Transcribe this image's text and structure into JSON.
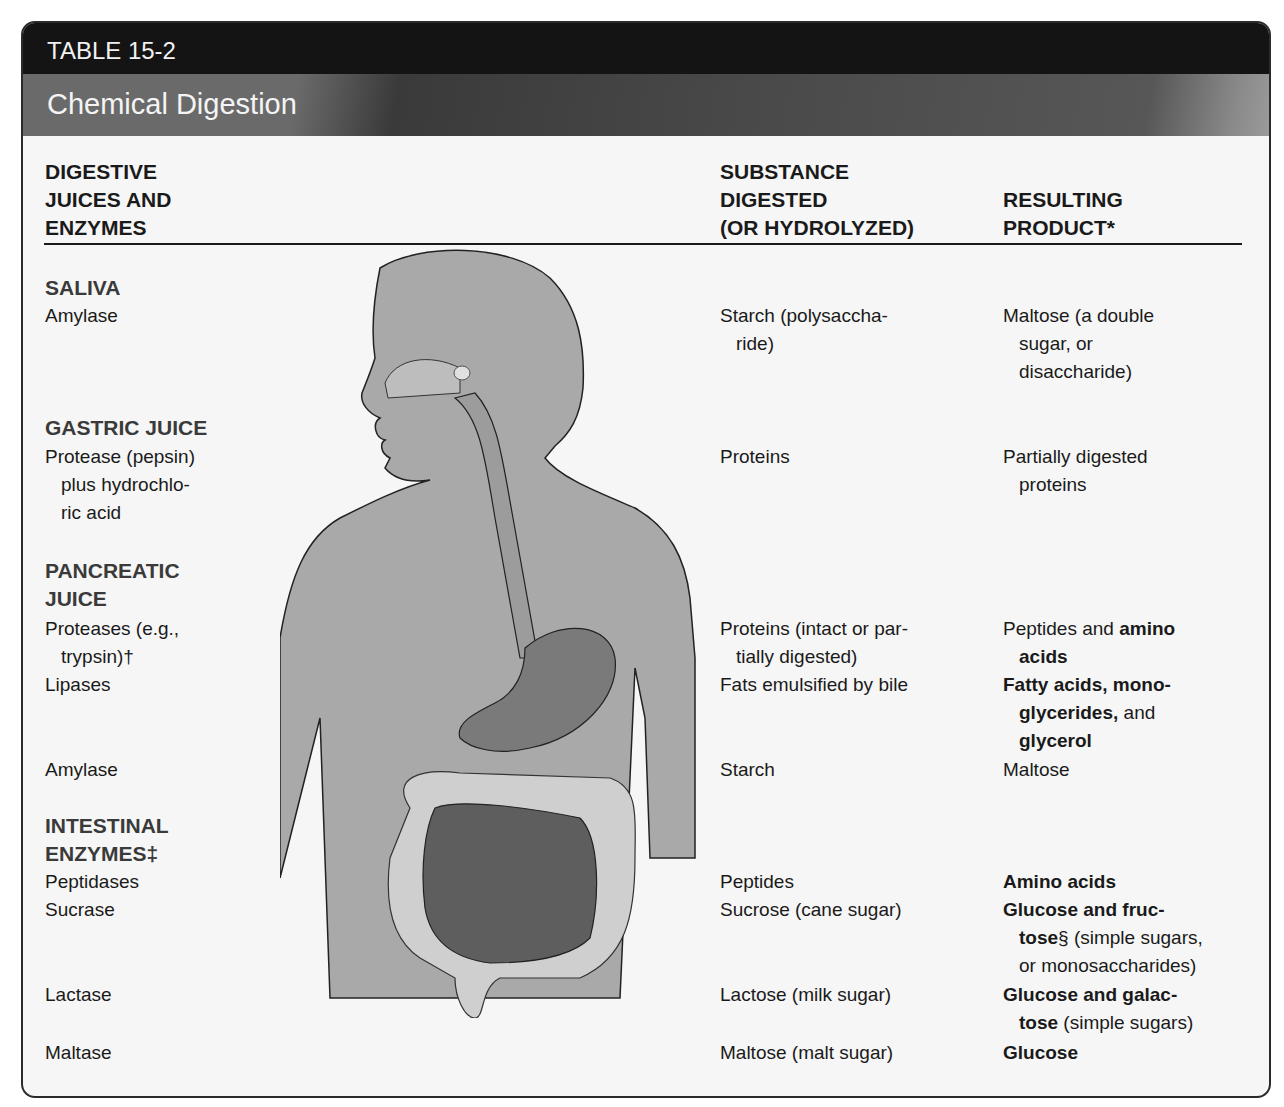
{
  "table": {
    "label": "TABLE 15-2",
    "title": "Chemical Digestion",
    "columns": {
      "enzymes": [
        "DIGESTIVE",
        "JUICES AND",
        "ENZYMES"
      ],
      "substance": [
        "SUBSTANCE",
        "DIGESTED",
        "(OR HYDROLYZED)"
      ],
      "product": [
        "RESULTING",
        "PRODUCT*"
      ]
    },
    "sections": {
      "saliva": "SALIVA",
      "gastric": "GASTRIC JUICE",
      "pancreatic": [
        "PANCREATIC",
        "JUICE"
      ],
      "intestinal": [
        "INTESTINAL",
        "ENZYMES‡"
      ]
    },
    "rows": {
      "saliva_amylase": {
        "enzyme": "Amylase",
        "substance": [
          "Starch (polysaccha-",
          "ride)"
        ],
        "product": [
          "Maltose (a double",
          "sugar, or",
          "disaccharide)"
        ]
      },
      "pepsin": {
        "enzyme": [
          "Protease (pepsin)",
          "plus hydrochlo-",
          "ric acid"
        ],
        "substance": "Proteins",
        "product": [
          "Partially digested",
          "proteins"
        ]
      },
      "trypsin": {
        "enzyme": [
          "Proteases (e.g.,",
          "trypsin)†"
        ],
        "substance": [
          "Proteins (intact or par-",
          "tially digested)"
        ],
        "product_plain": "Peptides and ",
        "product_bold": "amino",
        "product_line2_bold": "acids"
      },
      "lipases": {
        "enzyme": "Lipases",
        "substance": "Fats emulsified by bile",
        "product_line1_bold": "Fatty acids, mono-",
        "product_line2_bold": "glycerides,",
        "product_line2_plain": " and",
        "product_line3_bold": "glycerol"
      },
      "pancreatic_amylase": {
        "enzyme": "Amylase",
        "substance": "Starch",
        "product": "Maltose"
      },
      "peptidases": {
        "enzyme": "Peptidases",
        "substance": "Peptides",
        "product_bold": "Amino acids"
      },
      "sucrase": {
        "enzyme": "Sucrase",
        "substance": "Sucrose (cane sugar)",
        "product_line1_bold": "Glucose and fruc-",
        "product_line2_bold": "tose",
        "product_line2_plain": "§ (simple sugars,",
        "product_line3_plain": "or monosaccharides)"
      },
      "lactase": {
        "enzyme": "Lactase",
        "substance": "Lactose (milk sugar)",
        "product_line1_bold": "Glucose and galac-",
        "product_line2_bold": "tose",
        "product_line2_plain": " (simple sugars)"
      },
      "maltase": {
        "enzyme": "Maltase",
        "substance": "Maltose (malt sugar)",
        "product_bold": "Glucose"
      }
    }
  }
}
